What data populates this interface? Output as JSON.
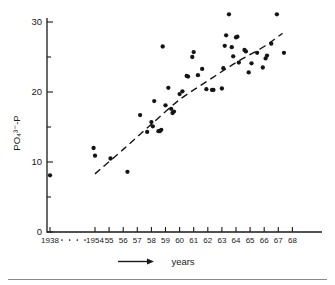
{
  "chart_data": {
    "type": "scatter",
    "title": "",
    "xlabel": "years",
    "ylabel": "PO₄³⁻-P",
    "xlabel_prefix_icon": "right-arrow-icon",
    "ylim": [
      0,
      31.5
    ],
    "ytick_values": [
      0,
      10,
      20,
      30
    ],
    "ytick_labels": [
      "0",
      "10",
      "20",
      "30"
    ],
    "yminor_tick_values": [
      5,
      15,
      25
    ],
    "grid": false,
    "legend": null,
    "axis_break": {
      "present": true,
      "marker": "dotted",
      "between": [
        "1938",
        "1954"
      ]
    },
    "xtick_labels": [
      "1938",
      "1954",
      "55",
      "56",
      "57",
      "58",
      "59",
      "60",
      "61",
      "62",
      "63",
      "64",
      "65",
      "66",
      "67",
      "68"
    ],
    "xtick_years": [
      1938,
      1954,
      1955,
      1956,
      1957,
      1958,
      1959,
      1960,
      1961,
      1962,
      1963,
      1964,
      1965,
      1966,
      1967,
      1968
    ],
    "series": [
      {
        "name": "PO4-P measurements",
        "marker": "filled-circle",
        "color": "#141414",
        "points": [
          {
            "x": 1938.0,
            "y": 8.1
          },
          {
            "x": 1953.9,
            "y": 12.0
          },
          {
            "x": 1954.0,
            "y": 10.9
          },
          {
            "x": 1955.1,
            "y": 10.5
          },
          {
            "x": 1956.3,
            "y": 8.6
          },
          {
            "x": 1957.2,
            "y": 16.7
          },
          {
            "x": 1957.7,
            "y": 14.3
          },
          {
            "x": 1958.0,
            "y": 15.7
          },
          {
            "x": 1958.1,
            "y": 15.1
          },
          {
            "x": 1958.2,
            "y": 18.7
          },
          {
            "x": 1958.5,
            "y": 14.4
          },
          {
            "x": 1958.6,
            "y": 14.4
          },
          {
            "x": 1958.7,
            "y": 14.6
          },
          {
            "x": 1958.8,
            "y": 26.5
          },
          {
            "x": 1959.0,
            "y": 18.1
          },
          {
            "x": 1959.2,
            "y": 20.6
          },
          {
            "x": 1959.4,
            "y": 17.6
          },
          {
            "x": 1959.5,
            "y": 17.0
          },
          {
            "x": 1959.6,
            "y": 17.2
          },
          {
            "x": 1960.0,
            "y": 19.7
          },
          {
            "x": 1960.2,
            "y": 20.1
          },
          {
            "x": 1960.5,
            "y": 22.3
          },
          {
            "x": 1960.6,
            "y": 22.2
          },
          {
            "x": 1960.9,
            "y": 25.0
          },
          {
            "x": 1961.0,
            "y": 25.7
          },
          {
            "x": 1961.3,
            "y": 22.4
          },
          {
            "x": 1961.6,
            "y": 23.3
          },
          {
            "x": 1961.9,
            "y": 20.4
          },
          {
            "x": 1962.3,
            "y": 20.3
          },
          {
            "x": 1962.4,
            "y": 20.3
          },
          {
            "x": 1963.0,
            "y": 20.5
          },
          {
            "x": 1963.1,
            "y": 23.4
          },
          {
            "x": 1963.2,
            "y": 26.6
          },
          {
            "x": 1963.3,
            "y": 28.1
          },
          {
            "x": 1963.5,
            "y": 31.1
          },
          {
            "x": 1963.7,
            "y": 26.4
          },
          {
            "x": 1963.8,
            "y": 25.1
          },
          {
            "x": 1964.0,
            "y": 27.8
          },
          {
            "x": 1964.1,
            "y": 27.9
          },
          {
            "x": 1964.2,
            "y": 24.2
          },
          {
            "x": 1964.6,
            "y": 26.0
          },
          {
            "x": 1964.7,
            "y": 25.8
          },
          {
            "x": 1964.9,
            "y": 22.8
          },
          {
            "x": 1965.1,
            "y": 24.1
          },
          {
            "x": 1965.5,
            "y": 25.6
          },
          {
            "x": 1965.9,
            "y": 23.5
          },
          {
            "x": 1966.1,
            "y": 24.8
          },
          {
            "x": 1966.2,
            "y": 25.2
          },
          {
            "x": 1966.5,
            "y": 26.9
          },
          {
            "x": 1966.9,
            "y": 31.1
          },
          {
            "x": 1967.4,
            "y": 25.6
          }
        ]
      }
    ],
    "trend": {
      "name": "fitted trend",
      "style": "dashed",
      "color": "#141414",
      "points": [
        {
          "x": 1954.0,
          "y": 8.3
        },
        {
          "x": 1956.0,
          "y": 11.8
        },
        {
          "x": 1958.0,
          "y": 15.4
        },
        {
          "x": 1960.0,
          "y": 18.9
        },
        {
          "x": 1962.0,
          "y": 21.6
        },
        {
          "x": 1964.0,
          "y": 24.2
        },
        {
          "x": 1966.0,
          "y": 26.5
        },
        {
          "x": 1967.3,
          "y": 28.4
        }
      ]
    }
  }
}
